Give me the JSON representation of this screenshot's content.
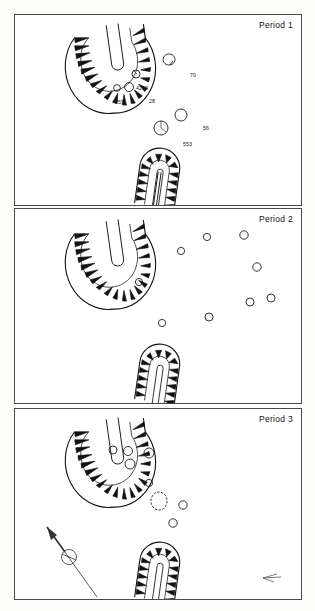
{
  "figure": {
    "type": "archaeological-site-plan",
    "panel_count": 3
  },
  "panels": [
    {
      "id": "period-1",
      "title": "Period 1",
      "structures": [
        {
          "name": "curvilinear-hachured-enclosure",
          "shape": "horseshoe-ring-ditch-with-central-slot"
        },
        {
          "name": "apsidal-hachured-building",
          "shape": "rounded-end-elongated-structure-with-central-slot"
        }
      ],
      "features": [
        {
          "label": "70",
          "x": 168,
          "y": 62,
          "r": 5.5,
          "label_dx": 7,
          "label_dy": -2
        },
        {
          "label": "4250",
          "x": 135,
          "y": 73,
          "r": 4.0,
          "label_dx": 4,
          "label_dy": 2
        },
        {
          "label": "28",
          "x": 128,
          "y": 86,
          "r": 4.5,
          "label_dx": 6,
          "label_dy": 2
        },
        {
          "label": "4255",
          "x": 116,
          "y": 87,
          "r": 3.5,
          "label_dx": -18,
          "label_dy": 2
        },
        {
          "label": "56",
          "x": 180,
          "y": 114,
          "r": 6.0,
          "label_dx": 8,
          "label_dy": -2
        },
        {
          "label": "553",
          "x": 160,
          "y": 127,
          "r": 7.0,
          "label_dx": 8,
          "label_dy": 3
        }
      ]
    },
    {
      "id": "period-2",
      "title": "Period 2",
      "structures": [
        {
          "name": "curvilinear-hachured-enclosure",
          "shape": "horseshoe-ring-ditch-with-central-slot"
        },
        {
          "name": "apsidal-hachured-building",
          "shape": "rounded-end-elongated-structure-with-central-slot"
        }
      ],
      "features": [
        {
          "label": "30",
          "x": 206,
          "y": 236,
          "r": 3.6,
          "label_dx": 5,
          "label_dy": 1
        },
        {
          "label": "18",
          "x": 243,
          "y": 234,
          "r": 4.2,
          "label_dx": 6,
          "label_dy": 0
        },
        {
          "label": "10",
          "x": 180,
          "y": 250,
          "r": 3.6,
          "label_dx": 5,
          "label_dy": 0
        },
        {
          "label": "78",
          "x": 256,
          "y": 266,
          "r": 4.2,
          "label_dx": -13,
          "label_dy": 1
        },
        {
          "label": "4258",
          "x": 138,
          "y": 281,
          "r": 3.6,
          "label_dx": 5,
          "label_dy": 2
        },
        {
          "label": "40",
          "x": 249,
          "y": 301,
          "r": 4.0,
          "label_dx": 5,
          "label_dy": 1
        },
        {
          "label": "50",
          "x": 270,
          "y": 297,
          "r": 4.0,
          "label_dx": 5,
          "label_dy": 0
        },
        {
          "label": "25",
          "x": 208,
          "y": 316,
          "r": 4.0,
          "label_dx": 5,
          "label_dy": 2
        },
        {
          "label": "4252",
          "x": 161,
          "y": 322,
          "r": 3.6,
          "label_dx": 5,
          "label_dy": 2
        }
      ]
    },
    {
      "id": "period-3",
      "title": "Period 3",
      "structures": [
        {
          "name": "curvilinear-hachured-enclosure",
          "shape": "horseshoe-ring-ditch-with-central-slot"
        },
        {
          "name": "apsidal-hachured-building",
          "shape": "rounded-end-elongated-structure-with-central-slot"
        }
      ],
      "features": [
        {
          "label": "716",
          "x": 112,
          "y": 457,
          "r": 4.0,
          "label_dx": -13,
          "label_dy": 1
        },
        {
          "label": "576",
          "x": 127,
          "y": 458,
          "r": 4.5,
          "label_dx": 6,
          "label_dy": -3
        },
        {
          "label": "4258",
          "x": 148,
          "y": 460,
          "r": 5.0,
          "label_dx": 7,
          "label_dy": 2
        },
        {
          "label": "580",
          "x": 129,
          "y": 471,
          "r": 5.0,
          "label_dx": 7,
          "label_dy": 2
        },
        {
          "label": "67",
          "x": 148,
          "y": 490,
          "r": 3.6,
          "label_dx": 5,
          "label_dy": 1
        },
        {
          "label": "557",
          "x": 158,
          "y": 508,
          "r": 8.0,
          "label_dx": 8,
          "label_dy": -4
        },
        {
          "label": "4242",
          "x": 182,
          "y": 512,
          "r": 4.2,
          "label_dx": 6,
          "label_dy": 2
        },
        {
          "label": "4253",
          "x": 172,
          "y": 530,
          "r": 4.2,
          "label_dx": 6,
          "label_dy": 2
        }
      ],
      "scale_bar": {
        "start_label": "0",
        "end_label": "5",
        "unit_label": "metres",
        "divisions": 5
      },
      "north_arrow": {
        "name": "north-arrow",
        "bearing": "up-left"
      },
      "corner_marker": {
        "name": "direction-arrow",
        "bearing": "left"
      }
    }
  ],
  "colors": {
    "ink": "#1a1a1a",
    "border": "#4a4a4a",
    "paper": "#ffffff",
    "hachure_fill": "#111111"
  }
}
